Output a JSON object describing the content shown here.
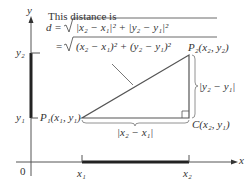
{
  "title": "This distance is",
  "formula": {
    "line1_prefix": "d =",
    "line1_radicand": "|x₂ − x₁|² + |y₂ − y₁|²",
    "line2_prefix": "=",
    "line2_radicand": "(x₂ − x₁)² + (y₂ − y₁)²"
  },
  "axes": {
    "x_label": "x",
    "y_label": "y",
    "origin_label": "0",
    "x_ticks": [
      "x₁",
      "x₂"
    ],
    "y_ticks": [
      "y₁",
      "y₂"
    ]
  },
  "points": {
    "p1": "P₁(x₁, y₁)",
    "p2": "P₂(x₂, y₂)",
    "c": "C(x₂, y₁)"
  },
  "legs": {
    "horizontal": "|x₂ − x₁|",
    "vertical": "|y₂ − y₁|"
  },
  "colors": {
    "line": "#555555",
    "thick": "#222222",
    "text": "#333333"
  }
}
